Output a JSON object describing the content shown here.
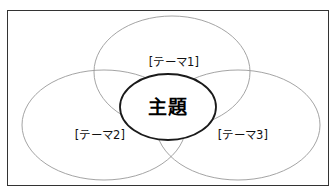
{
  "figure": {
    "title_text": "主題",
    "frame": {
      "border_color": "#333333",
      "background_color": "#ffffff"
    },
    "center": {
      "label": "主題",
      "stroke_color": "#1a1a1a",
      "fill_color": "#ffffff"
    },
    "themes": [
      {
        "id": "theme-1",
        "label": "[テーマ1]",
        "position": "top",
        "stroke_color": "#9a9a9a",
        "fill_color": "#ffffff"
      },
      {
        "id": "theme-2",
        "label": "[テーマ2]",
        "position": "bottom-left",
        "stroke_color": "#9a9a9a",
        "fill_color": "#ffffff"
      },
      {
        "id": "theme-3",
        "label": "[テーマ3]",
        "position": "bottom-right",
        "stroke_color": "#9a9a9a",
        "fill_color": "#ffffff"
      }
    ]
  },
  "chart_data": {
    "type": "diagram",
    "diagram_kind": "venn-trefoil",
    "title": "主題",
    "sets": [
      {
        "name": "[テーマ1]",
        "cx": 172,
        "cy": 72,
        "rx": 78,
        "ry": 56
      },
      {
        "name": "[テーマ2]",
        "cx": 104,
        "cy": 125,
        "rx": 82,
        "ry": 55
      },
      {
        "name": "[テーマ3]",
        "cx": 238,
        "cy": 125,
        "rx": 82,
        "ry": 55
      }
    ],
    "center_set": {
      "name": "主題",
      "cx": 168,
      "cy": 107,
      "rx": 48,
      "ry": 33
    },
    "legend": "none",
    "grid": false
  }
}
